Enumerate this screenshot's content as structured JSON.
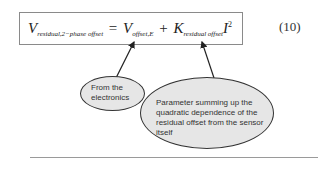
{
  "equation": {
    "lhs_symbol": "V",
    "lhs_sub": "residual,2−phase offset",
    "equals": "=",
    "t1_symbol": "V",
    "t1_sub": "offset,E",
    "plus": "+",
    "t2_symbol": "K",
    "t2_sub": "residual offset",
    "t2_var": "I",
    "t2_exp": "2",
    "number": "(10)"
  },
  "callouts": {
    "electronics": "From the electronics",
    "sensor": "Parameter summing up the quadratic dependence of the residual offset from the sensor itself"
  }
}
